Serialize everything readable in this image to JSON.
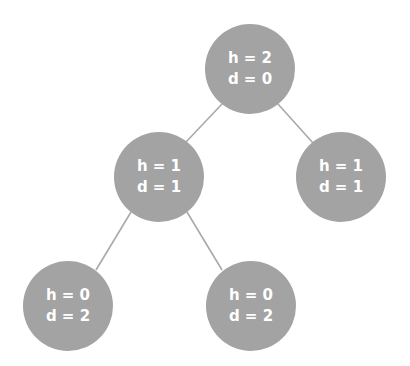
{
  "diagram": {
    "type": "binary-tree",
    "colors": {
      "node_fill": "#a3a3a3",
      "node_text": "#ffffff",
      "edge": "#a9a9a9",
      "background": "#ffffff"
    },
    "nodes": [
      {
        "id": "root",
        "h_label": "h = 2",
        "d_label": "d = 0",
        "cx": 250,
        "cy": 69
      },
      {
        "id": "left",
        "h_label": "h = 1",
        "d_label": "d = 1",
        "cx": 159,
        "cy": 177
      },
      {
        "id": "right",
        "h_label": "h = 1",
        "d_label": "d = 1",
        "cx": 341,
        "cy": 177
      },
      {
        "id": "left-left",
        "h_label": "h = 0",
        "d_label": "d = 2",
        "cx": 68,
        "cy": 306
      },
      {
        "id": "left-right",
        "h_label": "h = 0",
        "d_label": "d = 2",
        "cx": 251,
        "cy": 306
      }
    ],
    "edges": [
      {
        "from": "root",
        "to": "left"
      },
      {
        "from": "root",
        "to": "right"
      },
      {
        "from": "left",
        "to": "left-left"
      },
      {
        "from": "left",
        "to": "left-right"
      }
    ]
  }
}
